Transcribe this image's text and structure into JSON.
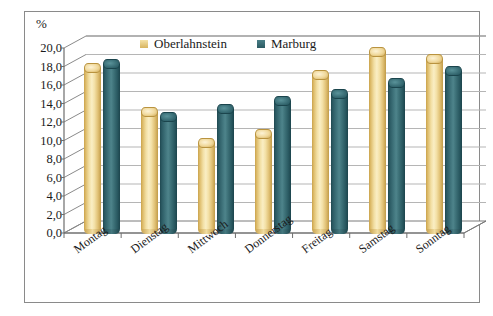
{
  "chart_data": {
    "type": "bar",
    "title": "",
    "subtitle": "",
    "xlabel": "",
    "ylabel": "%",
    "unit_label": "%",
    "ylim": [
      0,
      20
    ],
    "ytick_step": 2,
    "ytick_labels": [
      "0,0",
      "2,0",
      "4,0",
      "6,0",
      "8,0",
      "10,0",
      "12,0",
      "14,0",
      "16,0",
      "18,0",
      "20,0"
    ],
    "ytick_values": [
      0,
      2,
      4,
      6,
      8,
      10,
      12,
      14,
      16,
      18,
      20
    ],
    "grid": true,
    "legend_position": "top-center",
    "three_d": true,
    "categories": [
      "Montag",
      "Dienstag",
      "Mittwoch",
      "Donnerstag",
      "Freitag",
      "Samstag",
      "Sonntag"
    ],
    "series": [
      {
        "name": "Oberlahnstein",
        "color": "#e8cf84",
        "values": [
          17.4,
          12.7,
          9.3,
          10.3,
          16.6,
          19.1,
          18.4
        ]
      },
      {
        "name": "Marburg",
        "color": "#3a6e76",
        "values": [
          17.8,
          12.1,
          13.0,
          13.8,
          14.6,
          15.8,
          17.1
        ]
      }
    ]
  },
  "legend": {
    "items": [
      {
        "label": "Oberlahnstein",
        "swatch": "legend-swatch-yellow"
      },
      {
        "label": "Marburg",
        "swatch": "legend-swatch-teal"
      }
    ]
  },
  "axis": {
    "unit": "%"
  }
}
